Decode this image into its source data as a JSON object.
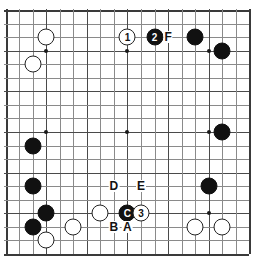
{
  "diagram": {
    "kind": "go-board",
    "board_size": 19,
    "colors": {
      "background": "#ffffff",
      "grid_line": "#8a8a8a",
      "grid_line_major": "#4a4a4a",
      "grid_edge": "#3a3a3a",
      "black_stone": "#111111",
      "white_stone": "#ffffff",
      "stone_outline": "#222222",
      "star_point": "#1a1a1a"
    },
    "star_points": [
      {
        "col": 3,
        "row": 3
      },
      {
        "col": 9,
        "row": 3
      },
      {
        "col": 15,
        "row": 3
      },
      {
        "col": 3,
        "row": 9
      },
      {
        "col": 9,
        "row": 9
      },
      {
        "col": 15,
        "row": 9
      },
      {
        "col": 3,
        "row": 15
      },
      {
        "col": 9,
        "row": 15
      },
      {
        "col": 15,
        "row": 15
      }
    ],
    "stones": [
      {
        "id": "w-c2r2",
        "color": "white",
        "col": 3,
        "row": 2,
        "label": ""
      },
      {
        "id": "w-c1r4",
        "color": "white",
        "col": 2,
        "row": 4,
        "label": ""
      },
      {
        "id": "w-move1",
        "color": "white",
        "col": 9,
        "row": 2,
        "label": "1"
      },
      {
        "id": "b-move2",
        "color": "black",
        "col": 11,
        "row": 2,
        "label": "2"
      },
      {
        "id": "b-c14r2",
        "color": "black",
        "col": 14,
        "row": 2,
        "label": ""
      },
      {
        "id": "b-c16r3",
        "color": "black",
        "col": 16,
        "row": 3,
        "label": ""
      },
      {
        "id": "b-c16r9",
        "color": "black",
        "col": 16,
        "row": 9,
        "label": ""
      },
      {
        "id": "b-c2r10",
        "color": "black",
        "col": 2,
        "row": 10,
        "label": ""
      },
      {
        "id": "b-c2r13",
        "color": "black",
        "col": 2,
        "row": 13,
        "label": ""
      },
      {
        "id": "b-c15r13",
        "color": "black",
        "col": 15,
        "row": 13,
        "label": ""
      },
      {
        "id": "w-c7r15",
        "color": "white",
        "col": 7,
        "row": 15,
        "label": ""
      },
      {
        "id": "b-markC",
        "color": "black",
        "col": 9,
        "row": 15,
        "label": "C"
      },
      {
        "id": "w-move3",
        "color": "white",
        "col": 10,
        "row": 15,
        "label": "3"
      },
      {
        "id": "b-c3r15",
        "color": "black",
        "col": 3,
        "row": 15,
        "label": ""
      },
      {
        "id": "b-c2r16",
        "color": "black",
        "col": 2,
        "row": 16,
        "label": ""
      },
      {
        "id": "w-c5r16",
        "color": "white",
        "col": 5,
        "row": 16,
        "label": ""
      },
      {
        "id": "w-c14r16",
        "color": "white",
        "col": 14,
        "row": 16,
        "label": ""
      },
      {
        "id": "w-c16r16",
        "color": "white",
        "col": 16,
        "row": 16,
        "label": ""
      },
      {
        "id": "w-c3r17",
        "color": "white",
        "col": 3,
        "row": 17,
        "label": ""
      }
    ],
    "point_labels": [
      {
        "id": "label-F",
        "text": "F",
        "col": 12,
        "row": 2
      },
      {
        "id": "label-D",
        "text": "D",
        "col": 8,
        "row": 13
      },
      {
        "id": "label-E",
        "text": "E",
        "col": 10,
        "row": 13
      },
      {
        "id": "label-B",
        "text": "B",
        "col": 8,
        "row": 16
      },
      {
        "id": "label-A",
        "text": "A",
        "col": 9,
        "row": 16
      }
    ]
  }
}
